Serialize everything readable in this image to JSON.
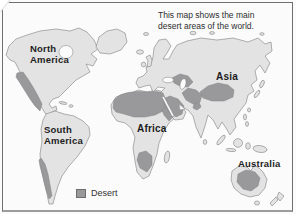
{
  "caption": {
    "line1": "This map shows the main",
    "line2": "desert areas of the world."
  },
  "labels": {
    "north_america": {
      "line1": "North",
      "line2": "America"
    },
    "south_america": {
      "line1": "South",
      "line2": "America"
    },
    "africa": "Africa",
    "asia": "Asia",
    "australia": "Australia"
  },
  "legend": {
    "desert": "Desert"
  },
  "colors": {
    "land": "#e3e3e3",
    "desert": "#99999b",
    "coast": "#8f8f8f",
    "ocean": "#fbfbfb",
    "frame": "#6f6f6f",
    "frame_bottom": "#9c9c9c",
    "label_text": "#1d1d1d",
    "caption_text": "#2e2e2e",
    "legend_text": "#333333"
  }
}
